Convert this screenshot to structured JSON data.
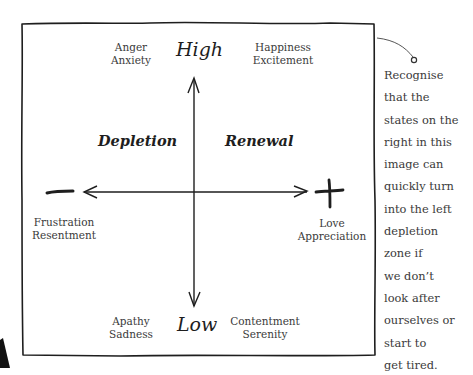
{
  "diagram": {
    "axis": {
      "top_label": "High",
      "bottom_label": "Low",
      "left_symbol": "minus",
      "right_symbol": "plus"
    },
    "zones": {
      "left": "Depletion",
      "right": "Renewal"
    },
    "emotions": {
      "top_left": [
        "Anger",
        "Anxiety"
      ],
      "top_right": [
        "Happiness",
        "Excitement"
      ],
      "left": [
        "Frustration",
        "Resentment"
      ],
      "right": [
        "Love",
        "Appreciation"
      ],
      "bottom_left": [
        "Apathy",
        "Sadness"
      ],
      "bottom_right": [
        "Contentment",
        "Serenity"
      ]
    },
    "callout": {
      "lines": [
        "Recognise",
        "that the",
        "states on the",
        "right in this",
        "image can",
        "quickly turn",
        "into the left",
        "depletion",
        "zone if",
        "we don’t",
        "look after",
        "ourselves or",
        "start to",
        "get tired."
      ]
    },
    "colors": {
      "stroke": "#1e1e1e",
      "text": "#3a3a3a",
      "background": "#ffffff"
    }
  }
}
